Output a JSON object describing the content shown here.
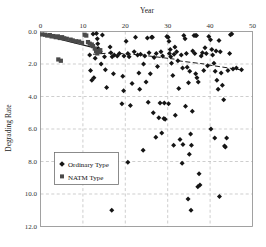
{
  "chart_data": {
    "type": "scatter",
    "title": "",
    "xlabel": "Year",
    "ylabel": "Degrading Rate",
    "xlim": [
      0,
      50
    ],
    "ylim": [
      0,
      12
    ],
    "y_inverted": true,
    "xticks": [
      "0",
      "10",
      "20",
      "30",
      "40",
      "50"
    ],
    "xtick_values": [
      0,
      10,
      20,
      30,
      40,
      50
    ],
    "yticks": [
      "0.0",
      "2.0",
      "4.0",
      "6.0",
      "8.0",
      "10.0",
      "12.0"
    ],
    "ytick_values": [
      0,
      2,
      4,
      6,
      8,
      10,
      12
    ],
    "grid": true,
    "grid_style": "dashed",
    "legend_position": "center-left",
    "series": [
      {
        "name": "Ordinary Type",
        "marker": "diamond",
        "color": "#151515",
        "points": [
          [
            13.2,
            0.12
          ],
          [
            13.4,
            0.45
          ],
          [
            13.5,
            0.75
          ],
          [
            13.6,
            1.05
          ],
          [
            14.6,
            0.22
          ],
          [
            15.1,
            1.55
          ],
          [
            15.3,
            2.35
          ],
          [
            15.6,
            3.45
          ],
          [
            14.1,
            1.25
          ],
          [
            14.3,
            2.0
          ],
          [
            16.4,
            0.95
          ],
          [
            16.6,
            1.3
          ],
          [
            16.9,
            1.55
          ],
          [
            17.2,
            2.6
          ],
          [
            17.4,
            1.45
          ],
          [
            18.1,
            1.5
          ],
          [
            18.6,
            1.35
          ],
          [
            19.4,
            2.75
          ],
          [
            19.7,
            1.5
          ],
          [
            20.2,
            0.6
          ],
          [
            20.6,
            1.35
          ],
          [
            20.9,
            1.55
          ],
          [
            21.6,
            3.2
          ],
          [
            22.1,
            1.25
          ],
          [
            22.4,
            0.35
          ],
          [
            22.9,
            1.45
          ],
          [
            23.2,
            2.55
          ],
          [
            23.6,
            1.4
          ],
          [
            24.3,
            2.0
          ],
          [
            24.6,
            1.5
          ],
          [
            24.9,
            3.1
          ],
          [
            25.2,
            0.4
          ],
          [
            25.6,
            1.3
          ],
          [
            25.9,
            2.6
          ],
          [
            26.2,
            0.35
          ],
          [
            26.4,
            0.35
          ],
          [
            26.8,
            1.6
          ],
          [
            27.3,
            1.35
          ],
          [
            27.6,
            2.15
          ],
          [
            27.9,
            5.3
          ],
          [
            28.4,
            1.25
          ],
          [
            28.8,
            1.5
          ],
          [
            29.1,
            5.35
          ],
          [
            29.4,
            5.4
          ],
          [
            29.8,
            0.3
          ],
          [
            30.1,
            0.35
          ],
          [
            30.3,
            0.6
          ],
          [
            30.6,
            1.1
          ],
          [
            30.4,
            1.35
          ],
          [
            30.7,
            1.55
          ],
          [
            30.9,
            1.95
          ],
          [
            31.2,
            2.7
          ],
          [
            31.5,
            1.4
          ],
          [
            31.7,
            0.95
          ],
          [
            32.1,
            1.25
          ],
          [
            32.4,
            1.8
          ],
          [
            32.6,
            3.5
          ],
          [
            32.9,
            6.65
          ],
          [
            33.2,
            1.45
          ],
          [
            33.5,
            2.25
          ],
          [
            33.8,
            0.25
          ],
          [
            34.1,
            0.45
          ],
          [
            34.4,
            1.35
          ],
          [
            34.6,
            2.2
          ],
          [
            34.9,
            3.15
          ],
          [
            35.2,
            2.45
          ],
          [
            35.4,
            6.3
          ],
          [
            35.6,
            7.0
          ],
          [
            35.9,
            1.2
          ],
          [
            36.2,
            0.25
          ],
          [
            36.5,
            0.25
          ],
          [
            36.8,
            0.25
          ],
          [
            36.4,
            1.35
          ],
          [
            36.6,
            2.6
          ],
          [
            36.9,
            2.85
          ],
          [
            37.2,
            3.1
          ],
          [
            37.4,
            8.75
          ],
          [
            37.6,
            9.45
          ],
          [
            37.9,
            1.5
          ],
          [
            38.2,
            1.3
          ],
          [
            38.5,
            2.4
          ],
          [
            38.8,
            1.0
          ],
          [
            39.1,
            1.35
          ],
          [
            39.4,
            2.1
          ],
          [
            39.7,
            0.3
          ],
          [
            40.1,
            0.5
          ],
          [
            40.4,
            1.1
          ],
          [
            40.6,
            1.45
          ],
          [
            40.9,
            1.95
          ],
          [
            41.2,
            2.45
          ],
          [
            41.4,
            1.2
          ],
          [
            41.6,
            3.0
          ],
          [
            41.9,
            3.55
          ],
          [
            42.1,
            0.55
          ],
          [
            42.4,
            1.25
          ],
          [
            42.6,
            2.55
          ],
          [
            42.9,
            3.3
          ],
          [
            43.2,
            4.2
          ],
          [
            43.4,
            7.05
          ],
          [
            43.6,
            7.1
          ],
          [
            43.9,
            6.55
          ],
          [
            44.2,
            2.4
          ],
          [
            44.6,
            1.35
          ],
          [
            45.1,
            0.15
          ],
          [
            45.4,
            2.3
          ],
          [
            46.2,
            2.25
          ],
          [
            47.4,
            2.35
          ],
          [
            12.6,
            2.85
          ],
          [
            12.9,
            1.65
          ],
          [
            19.2,
            4.45
          ],
          [
            19.6,
            3.65
          ],
          [
            21.2,
            4.55
          ],
          [
            23.4,
            3.55
          ],
          [
            25.4,
            4.35
          ],
          [
            28.2,
            4.4
          ],
          [
            29.2,
            4.4
          ],
          [
            30.2,
            4.45
          ],
          [
            26.6,
            5.0
          ],
          [
            31.8,
            5.15
          ],
          [
            34.2,
            4.6
          ],
          [
            35.8,
            4.9
          ],
          [
            33.4,
            8.1
          ],
          [
            34.8,
            10.3
          ],
          [
            37.1,
            9.55
          ],
          [
            40.2,
            6.0
          ],
          [
            41.1,
            6.55
          ],
          [
            42.2,
            10.15
          ],
          [
            20.6,
            8.05
          ],
          [
            24.2,
            7.3
          ],
          [
            27.2,
            6.5
          ],
          [
            28.6,
            6.25
          ],
          [
            31.4,
            7.0
          ],
          [
            33.6,
            6.95
          ],
          [
            35.1,
            7.55
          ],
          [
            16.8,
            11.0
          ],
          [
            35.5,
            11.0
          ],
          [
            44.8,
            0.2
          ],
          [
            12.4,
            0.15
          ],
          [
            11.6,
            1.45
          ],
          [
            11.8,
            2.4
          ],
          [
            12.1,
            3.0
          ]
        ]
      },
      {
        "name": "NATM Type",
        "marker": "square",
        "color": "#4a4a4a",
        "points": [
          [
            0.4,
            0.18
          ],
          [
            1.1,
            0.2
          ],
          [
            1.6,
            0.25
          ],
          [
            2.2,
            0.22
          ],
          [
            2.6,
            0.3
          ],
          [
            3.1,
            0.28
          ],
          [
            3.6,
            0.35
          ],
          [
            4.1,
            0.3
          ],
          [
            4.6,
            0.4
          ],
          [
            5.1,
            0.35
          ],
          [
            5.6,
            0.42
          ],
          [
            6.2,
            0.45
          ],
          [
            7.1,
            0.5
          ],
          [
            7.6,
            0.55
          ],
          [
            8.4,
            0.6
          ],
          [
            9.1,
            0.62
          ],
          [
            9.8,
            0.7
          ],
          [
            10.4,
            0.2
          ],
          [
            10.8,
            0.25
          ],
          [
            11.2,
            0.65
          ],
          [
            11.6,
            0.75
          ],
          [
            12.1,
            0.8
          ],
          [
            12.4,
            0.9
          ],
          [
            12.8,
            1.05
          ],
          [
            13.1,
            1.2
          ],
          [
            13.4,
            1.35
          ],
          [
            13.8,
            1.25
          ],
          [
            14.1,
            1.15
          ],
          [
            4.2,
            1.72
          ],
          [
            4.8,
            1.8
          ]
        ]
      }
    ],
    "trend_lines": [
      {
        "name": "natm-fit",
        "style": "solid",
        "points": [
          [
            0.2,
            0.2
          ],
          [
            14.2,
            1.1
          ]
        ]
      },
      {
        "name": "ord-fit-seg1",
        "style": "dashed",
        "points": [
          [
            12.4,
            1.4
          ],
          [
            17.6,
            1.3
          ]
        ]
      },
      {
        "name": "ord-fit-seg2",
        "style": "dashed",
        "points": [
          [
            18.4,
            1.35
          ],
          [
            24.4,
            1.45
          ]
        ]
      },
      {
        "name": "ord-fit-seg3",
        "style": "dashed",
        "points": [
          [
            25.4,
            1.5
          ],
          [
            31.6,
            1.7
          ]
        ]
      },
      {
        "name": "ord-fit-seg4",
        "style": "dashed",
        "points": [
          [
            32.4,
            1.8
          ],
          [
            38.6,
            2.0
          ]
        ]
      },
      {
        "name": "ord-fit-seg5",
        "style": "dashed",
        "points": [
          [
            39.4,
            2.05
          ],
          [
            47.0,
            2.35
          ]
        ]
      }
    ],
    "legend": [
      {
        "label": "Ordinary Type",
        "marker": "diamond"
      },
      {
        "label": "NATM Type",
        "marker": "square"
      }
    ]
  }
}
